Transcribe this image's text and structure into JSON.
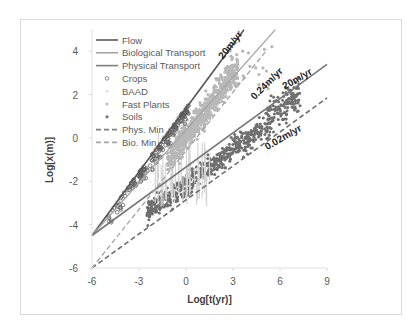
{
  "chart_data": {
    "type": "scatter",
    "title": "",
    "xlabel": "Log[t(yr)]",
    "ylabel": "Log[x(m)]",
    "xlim": [
      -6,
      9
    ],
    "ylim": [
      -6,
      5
    ],
    "xticks": [
      -6,
      -3,
      0,
      3,
      6,
      9
    ],
    "yticks": [
      -6,
      -4,
      -2,
      0,
      2,
      4
    ],
    "x_tick_labels": [
      "-6",
      "-3",
      "0",
      "3",
      "6",
      "9"
    ],
    "y_tick_labels": [
      "-6",
      "-4",
      "-2",
      "0",
      "2",
      "4"
    ],
    "grid": false,
    "legend_position": "upper left",
    "legend": [
      {
        "label": "Flow",
        "style": "solid-line",
        "color": "#595959"
      },
      {
        "label": "Biological Transport",
        "style": "solid-line",
        "color": "#a6a6a6"
      },
      {
        "label": "Physical Transport",
        "style": "solid-line",
        "color": "#7f7f7f"
      },
      {
        "label": "Crops",
        "style": "open-circle",
        "color": "#7f7f7f"
      },
      {
        "label": "BAAD",
        "style": "small-marker",
        "color": "#d9d9d9"
      },
      {
        "label": "Fast Plants",
        "style": "dot",
        "color": "#bfbfbf"
      },
      {
        "label": "Soils",
        "style": "dot",
        "color": "#737373"
      },
      {
        "label": "Phys. Min",
        "style": "dashed-line",
        "color": "#7f7f7f"
      },
      {
        "label": "Bio. Min",
        "style": "dashed-line",
        "color": "#a6a6a6"
      }
    ],
    "series": [
      {
        "name": "Flow",
        "kind": "line",
        "x": [
          -6,
          3.7
        ],
        "y": [
          -4.5,
          5.0
        ]
      },
      {
        "name": "Biological Transport",
        "kind": "line",
        "x": [
          -6,
          5.7
        ],
        "y": [
          -4.5,
          5.0
        ]
      },
      {
        "name": "Physical Transport",
        "kind": "line",
        "x": [
          -6,
          9
        ],
        "y": [
          -4.5,
          3.4
        ]
      },
      {
        "name": "Phys. Min",
        "kind": "dashed",
        "x": [
          -6,
          9
        ],
        "y": [
          -6,
          1.85
        ]
      },
      {
        "name": "Bio. Min",
        "kind": "dashed",
        "x": [
          -6,
          5.2
        ],
        "y": [
          -6,
          4.1
        ]
      },
      {
        "name": "Crops",
        "kind": "scatter",
        "description": "open circles clustered along Flow line from about (-5.5,-3.7) to (0,1.2)",
        "x_range": [
          -5.5,
          0.5
        ],
        "y_range": [
          -4,
          1.5
        ]
      },
      {
        "name": "BAAD",
        "kind": "scatter",
        "description": "light vertical streaks around x -1.5 to 1.5, y -3 to 0",
        "x_range": [
          -2,
          1.5
        ],
        "y_range": [
          -3.5,
          0.5
        ]
      },
      {
        "name": "Fast Plants",
        "kind": "scatter",
        "description": "dense light-gray cloud between Bio Transport and Bio Min lines",
        "x_range": [
          -1.5,
          5
        ],
        "y_range": [
          -1.5,
          4
        ]
      },
      {
        "name": "Soils",
        "kind": "scatter",
        "description": "dense dark-gray band between Physical Transport and Phys. Min lines",
        "x_range": [
          -3,
          8
        ],
        "y_range": [
          -3.5,
          2.5
        ]
      }
    ],
    "annotations": [
      {
        "text": "20m/yr",
        "x": 3.0,
        "y": 4.2,
        "rotation": -52
      },
      {
        "text": "0.24m/yr",
        "x": 5.3,
        "y": 2.4,
        "rotation": -45
      },
      {
        "text": "20m/yr",
        "x": 7.2,
        "y": 2.6,
        "rotation": -30
      },
      {
        "text": "0.02m/yr",
        "x": 6.3,
        "y": -0.1,
        "rotation": -30
      }
    ]
  },
  "axes": {
    "xlabel": "Log[t(yr)]",
    "ylabel": "Log[x(m)]"
  },
  "legend": {
    "items": [
      "Flow",
      "Biological Transport",
      "Physical Transport",
      "Crops",
      "BAAD",
      "Fast Plants",
      "Soils",
      "Phys. Min",
      "Bio. Min"
    ]
  },
  "annotations": {
    "flow_rate": "20m/yr",
    "bio_min_rate": "0.24m/yr",
    "phys_rate": "20m/yr",
    "phys_min_rate": "0.02m/yr"
  }
}
